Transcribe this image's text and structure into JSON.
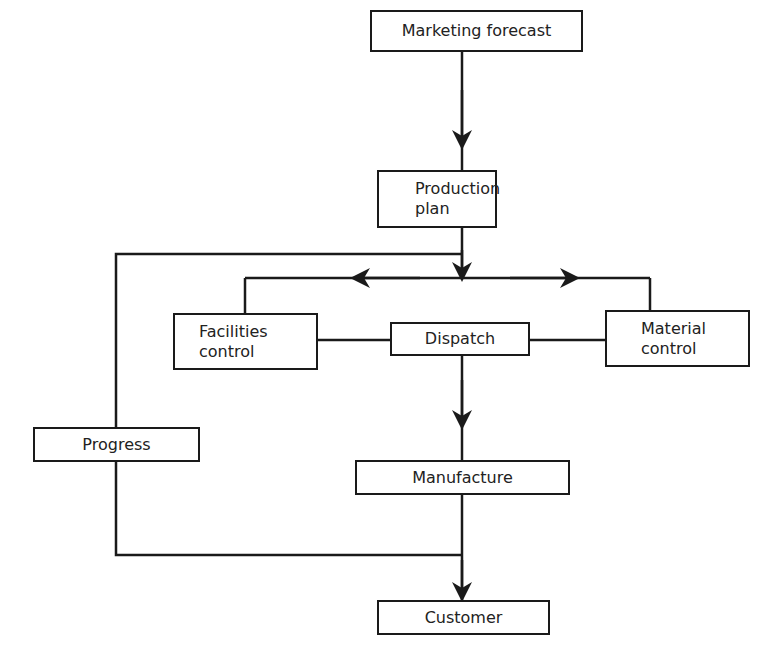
{
  "diagram": {
    "type": "flowchart",
    "title": "",
    "nodes": [
      {
        "id": "marketing_forecast",
        "label": "Marketing forecast"
      },
      {
        "id": "production_plan",
        "label": "Production\nplan"
      },
      {
        "id": "facilities_control",
        "label": "Facilities\ncontrol"
      },
      {
        "id": "dispatch",
        "label": "Dispatch"
      },
      {
        "id": "material_control",
        "label": "Material\ncontrol"
      },
      {
        "id": "progress",
        "label": "Progress"
      },
      {
        "id": "manufacture",
        "label": "Manufacture"
      },
      {
        "id": "customer",
        "label": "Customer"
      }
    ],
    "edges": [
      {
        "from": "marketing_forecast",
        "to": "production_plan",
        "arrow": true
      },
      {
        "from": "production_plan",
        "to": "distribution_bus",
        "arrow": true
      },
      {
        "from": "distribution_bus",
        "to": "facilities_control",
        "arrow": true
      },
      {
        "from": "distribution_bus",
        "to": "material_control",
        "arrow": true
      },
      {
        "from": "facilities_control",
        "to": "dispatch",
        "arrow": false
      },
      {
        "from": "material_control",
        "to": "dispatch",
        "arrow": false
      },
      {
        "from": "dispatch",
        "to": "manufacture",
        "arrow": true
      },
      {
        "from": "manufacture",
        "to": "customer",
        "arrow": true
      },
      {
        "from": "production_plan",
        "to": "progress",
        "arrow": false
      },
      {
        "from": "progress",
        "to": "customer",
        "arrow": true
      }
    ]
  }
}
